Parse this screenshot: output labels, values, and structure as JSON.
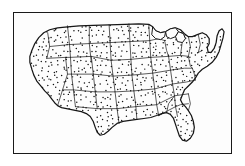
{
  "image": {
    "kind": "map",
    "subject": "Contiguous United States",
    "style": "black-and-white line art with dot stippling",
    "background_color": "#ffffff",
    "frame_color": "#1a1a1a",
    "outline_color": "#161616",
    "internal_border_color": "#222222",
    "dot_color": "#111111",
    "has_labels": false,
    "has_legend": false,
    "has_title": false,
    "frame": {
      "x": 13,
      "y": 12,
      "width": 219,
      "height": 142,
      "stroke_width": 1.6
    }
  },
  "map": {
    "projection_note": "simplified conterminous US silhouette",
    "regions_visible": [
      "Pacific Coast",
      "Mountain West",
      "Great Plains",
      "Midwest",
      "Great Lakes",
      "Northeast",
      "Mid-Atlantic",
      "Southeast",
      "Gulf Coast",
      "Florida Peninsula",
      "Texas",
      "Maine"
    ],
    "features": {
      "state_boundaries": true,
      "national_outline": true,
      "dot_stipple_fill": true,
      "great_lakes_cutout": true,
      "florida_peninsula": true,
      "maine_projection": true,
      "texas_gulf_coast": true,
      "california_coast": true
    },
    "stipple": {
      "pattern": "uniform scattered dots",
      "approx_spacing_px": 5,
      "dot_radius_px": 0.75,
      "density_description": "even coverage across all states"
    }
  },
  "chart_data": {
    "type": "map",
    "title": "",
    "subtitle": "",
    "xlabel": "",
    "ylabel": "",
    "legend": [],
    "annotations": [],
    "description": "Outline map of the 48 contiguous United States showing state borders, filled with an even dot-stipple pattern, enclosed in a thin rectangular border."
  }
}
